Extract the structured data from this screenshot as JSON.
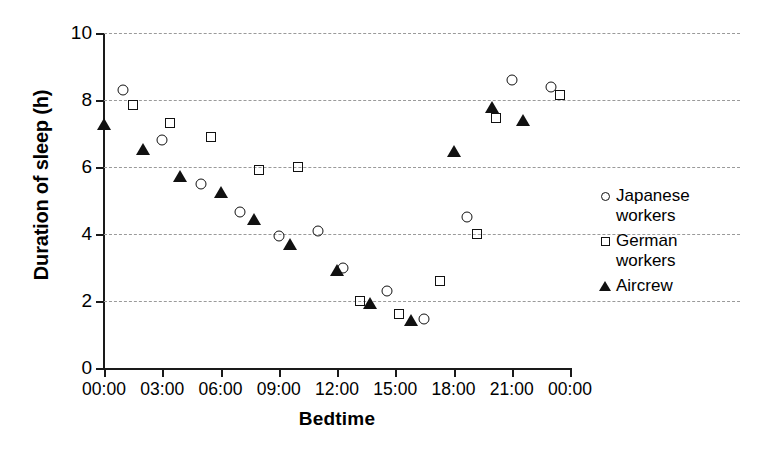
{
  "chart_data": {
    "type": "scatter",
    "title": "",
    "xlabel": "Bedtime",
    "ylabel": "Duration of sleep (h)",
    "ylim": [
      0,
      10
    ],
    "yticks": [
      0,
      2,
      4,
      6,
      8,
      10
    ],
    "ytick_labels": [
      "0",
      "2",
      "4",
      "6",
      "8",
      "10"
    ],
    "xlim_hours": [
      0,
      24
    ],
    "xticks_hours": [
      0,
      3,
      6,
      9,
      12,
      15,
      18,
      21,
      24
    ],
    "xtick_labels": [
      "00:00",
      "03:00",
      "06:00",
      "09:00",
      "12:00",
      "15:00",
      "18:00",
      "21:00",
      "00:00"
    ],
    "grid": "horizontal-dashed",
    "legend_position": "right",
    "series": [
      {
        "name": "Japanese workers",
        "marker": "open-circle",
        "color": "#111111",
        "points": [
          {
            "x": 1.0,
            "y": 8.3
          },
          {
            "x": 3.0,
            "y": 6.8
          },
          {
            "x": 5.0,
            "y": 5.5
          },
          {
            "x": 7.0,
            "y": 4.65
          },
          {
            "x": 9.0,
            "y": 3.95
          },
          {
            "x": 11.0,
            "y": 4.1
          },
          {
            "x": 12.3,
            "y": 3.0
          },
          {
            "x": 14.6,
            "y": 2.3
          },
          {
            "x": 16.5,
            "y": 1.45
          },
          {
            "x": 18.7,
            "y": 4.5
          },
          {
            "x": 21.0,
            "y": 8.6
          },
          {
            "x": 23.0,
            "y": 8.4
          }
        ]
      },
      {
        "name": "German workers",
        "marker": "open-square",
        "color": "#111111",
        "points": [
          {
            "x": 1.5,
            "y": 7.85
          },
          {
            "x": 3.4,
            "y": 7.3
          },
          {
            "x": 5.5,
            "y": 6.9
          },
          {
            "x": 8.0,
            "y": 5.9
          },
          {
            "x": 10.0,
            "y": 6.0
          },
          {
            "x": 13.2,
            "y": 2.0
          },
          {
            "x": 15.2,
            "y": 1.6
          },
          {
            "x": 17.3,
            "y": 2.6
          },
          {
            "x": 19.2,
            "y": 4.0
          },
          {
            "x": 20.2,
            "y": 7.45
          },
          {
            "x": 23.5,
            "y": 8.15
          }
        ]
      },
      {
        "name": "Aircrew",
        "marker": "filled-triangle",
        "color": "#111111",
        "points": [
          {
            "x": 0.0,
            "y": 7.35
          },
          {
            "x": 2.0,
            "y": 6.6
          },
          {
            "x": 3.9,
            "y": 5.8
          },
          {
            "x": 6.0,
            "y": 5.3
          },
          {
            "x": 7.7,
            "y": 4.5
          },
          {
            "x": 9.6,
            "y": 3.75
          },
          {
            "x": 12.0,
            "y": 3.0
          },
          {
            "x": 13.7,
            "y": 2.0
          },
          {
            "x": 15.8,
            "y": 1.5
          },
          {
            "x": 18.0,
            "y": 6.55
          },
          {
            "x": 20.0,
            "y": 7.85
          },
          {
            "x": 21.6,
            "y": 7.45
          }
        ]
      }
    ]
  },
  "axes": {
    "ylabel": "Duration of sleep (h)",
    "xlabel": "Bedtime"
  },
  "legend": {
    "entries": [
      {
        "label": "Japanese\nworkers",
        "marker": "open-circle"
      },
      {
        "label": "German\nworkers",
        "marker": "open-square"
      },
      {
        "label": "Aircrew",
        "marker": "filled-triangle"
      }
    ]
  }
}
